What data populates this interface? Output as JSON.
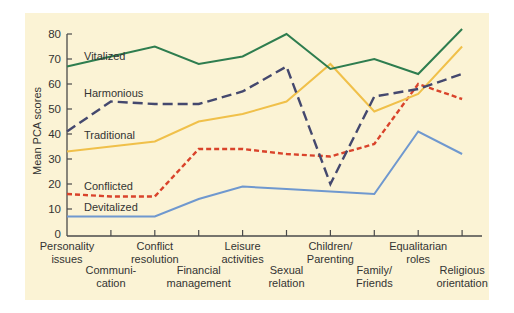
{
  "chart_data": {
    "type": "line",
    "title": "",
    "xlabel": "",
    "ylabel": "Mean PCA scores",
    "ylim": [
      0,
      80
    ],
    "yticks": [
      0,
      10,
      20,
      30,
      40,
      50,
      60,
      70,
      80
    ],
    "grid": false,
    "legend_position": "inline labels",
    "categories": [
      "Personality issues",
      "Communication",
      "Conflict resolution",
      "Financial management",
      "Leisure activities",
      "Sexual relation",
      "Children/Parenting",
      "Family/Friends",
      "Equalitarian roles",
      "Religious orientation"
    ],
    "category_labels_display": [
      [
        "Personality",
        "issues"
      ],
      [
        "Communi-",
        "cation"
      ],
      [
        "Conflict",
        "resolution"
      ],
      [
        "Financial",
        "management"
      ],
      [
        "Leisure",
        "activities"
      ],
      [
        "Sexual",
        "relation"
      ],
      [
        "Children/",
        "Parenting"
      ],
      [
        "Family/",
        "Friends"
      ],
      [
        "Equalitarian",
        "roles"
      ],
      [
        "Religious",
        "orientation"
      ]
    ],
    "series": [
      {
        "name": "Vitalized",
        "color": "#2e7d4f",
        "style": "solid",
        "values": [
          67,
          71,
          75,
          68,
          71,
          80,
          66,
          70,
          64,
          82
        ]
      },
      {
        "name": "Harmonious",
        "color": "#44486e",
        "style": "long-dash",
        "values": [
          41,
          53,
          52,
          52,
          57,
          67,
          20,
          55,
          58,
          64
        ]
      },
      {
        "name": "Traditional",
        "color": "#f0c04a",
        "style": "solid",
        "values": [
          33,
          35,
          37,
          45,
          48,
          53,
          68,
          49,
          56,
          75
        ]
      },
      {
        "name": "Conflicted",
        "color": "#d9432b",
        "style": "short-dash",
        "values": [
          16,
          15,
          15,
          34,
          34,
          32,
          31,
          36,
          60,
          54
        ]
      },
      {
        "name": "Devitalized",
        "color": "#6f98cf",
        "style": "solid",
        "values": [
          7,
          7,
          7,
          14,
          19,
          18,
          17,
          16,
          41,
          32
        ]
      }
    ]
  },
  "colors": {
    "panel_background": "#fbf3d5",
    "axis": "#4a4a4a",
    "text": "#333333"
  }
}
